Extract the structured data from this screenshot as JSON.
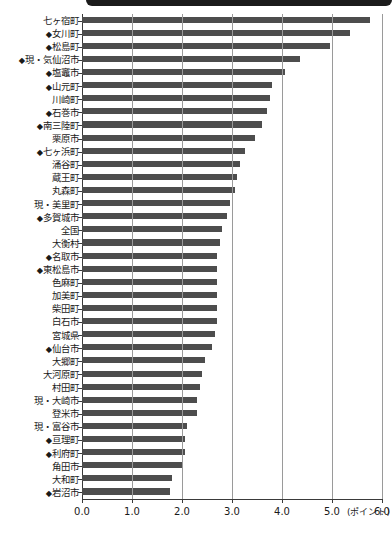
{
  "header": {
    "band_text": "",
    "band_color": "#1b1b1b"
  },
  "chart_data": {
    "type": "bar",
    "orientation": "horizontal",
    "title": "",
    "xlabel": "(ポイント)",
    "ylabel": "",
    "xlim": [
      0.0,
      6.0
    ],
    "xticks": [
      "0.0",
      "1.0",
      "2.0",
      "3.0",
      "4.0",
      "5.0",
      "6.0"
    ],
    "grid": true,
    "legend": "none",
    "bar_color": "#4d4d4d",
    "categories": [
      "七ヶ宿町",
      "◆女川町",
      "◆松島町",
      "◆現・気仙沼市",
      "◆塩竈市",
      "◆山元町",
      "川崎町",
      "◆石巻市",
      "◆南三陸町",
      "栗原市",
      "◆七ヶ浜町",
      "涌谷町",
      "蔵王町",
      "丸森町",
      "現・美里町",
      "◆多賀城市",
      "全国",
      "大衡村",
      "◆名取市",
      "◆東松島市",
      "色麻町",
      "加美町",
      "柴田町",
      "白石市",
      "宮城県",
      "◆仙台市",
      "大郷町",
      "大河原町",
      "村田町",
      "現・大崎市",
      "登米市",
      "現・富谷市",
      "◆亘理町",
      "◆利府町",
      "角田市",
      "大和町",
      "◆岩沼市"
    ],
    "values": [
      5.75,
      5.35,
      4.95,
      4.35,
      4.05,
      3.8,
      3.75,
      3.7,
      3.6,
      3.45,
      3.25,
      3.15,
      3.1,
      3.05,
      2.95,
      2.9,
      2.8,
      2.75,
      2.7,
      2.7,
      2.7,
      2.7,
      2.7,
      2.7,
      2.65,
      2.6,
      2.45,
      2.4,
      2.35,
      2.3,
      2.3,
      2.1,
      2.05,
      2.05,
      2.0,
      1.8,
      1.75
    ]
  },
  "footnote": ""
}
